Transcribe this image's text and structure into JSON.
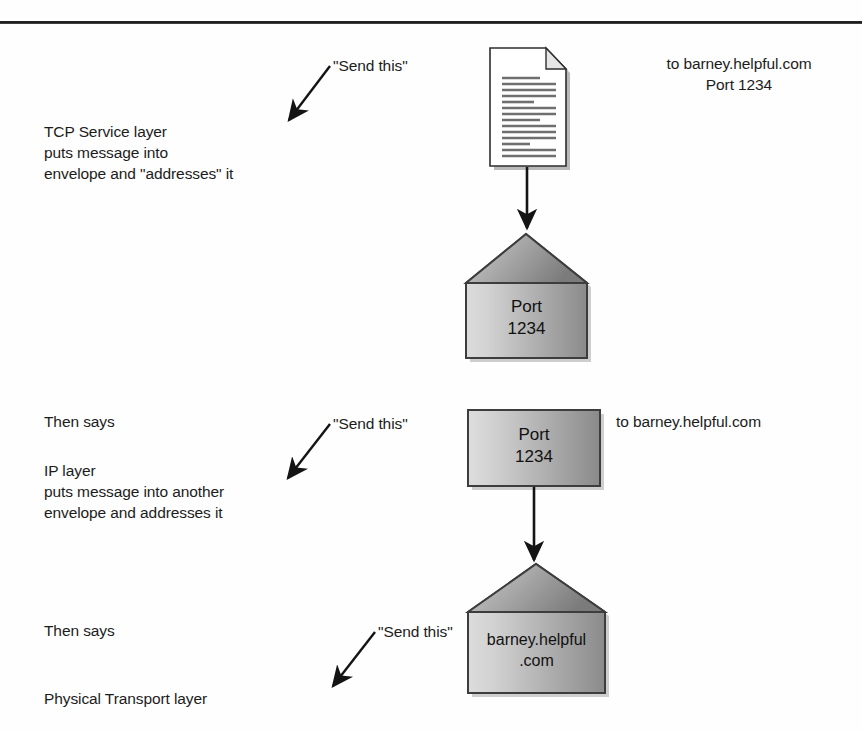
{
  "diagram": {
    "rule_color": "#1a1a1a",
    "background": "#fefefe"
  },
  "labels": {
    "send_this_1": "\"Send this\"",
    "send_this_2": "\"Send this\"",
    "send_this_3": "\"Send this\"",
    "tcp_layer": "TCP Service layer\nputs message into\nenvelope and \"addresses\" it",
    "then_says_1": "Then says",
    "ip_layer": "IP layer\nputs message into another\nenvelope and addresses it",
    "then_says_2": "Then says",
    "physical_layer": "Physical Transport layer",
    "addr_top": "to barney.helpful.com\nPort 1234",
    "addr_mid": "to barney.helpful.com"
  },
  "objects": {
    "document": {
      "name": "message document",
      "lines": 14
    },
    "envelope_top": {
      "text": "Port\n1234",
      "type": "open-flap-envelope"
    },
    "envelope_mid": {
      "text": "Port\n1234",
      "type": "sealed-rectangle"
    },
    "envelope_bottom": {
      "text": "barney.helpful\n.com",
      "type": "open-flap-envelope"
    }
  },
  "colors": {
    "envelope_light": "#d8d8d8",
    "envelope_dark": "#8e8e8e",
    "flap_light": "#c9c9c9",
    "flap_dark": "#7d7d7d",
    "stroke": "#3a3a3a",
    "arrow": "#141414",
    "doc_line": "#6e6e6e"
  }
}
